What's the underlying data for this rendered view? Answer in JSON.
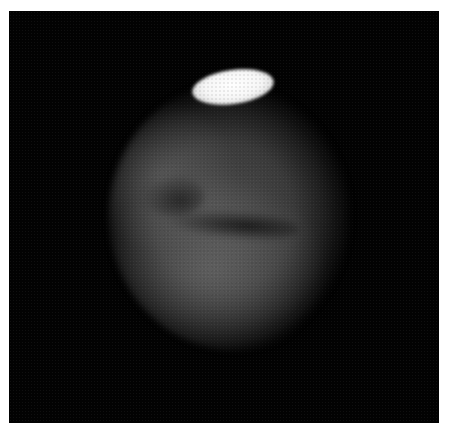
{
  "image": {
    "subject": "Mars telescope image",
    "description": "Grayscale planetary disk with bright polar cap at top and dark surface markings across the middle",
    "colors": {
      "background": "#020202",
      "border": "#ffffff",
      "disk": "#4e4e4e",
      "polar_cap": "#ffffff",
      "dark_markings": "#151515"
    }
  }
}
